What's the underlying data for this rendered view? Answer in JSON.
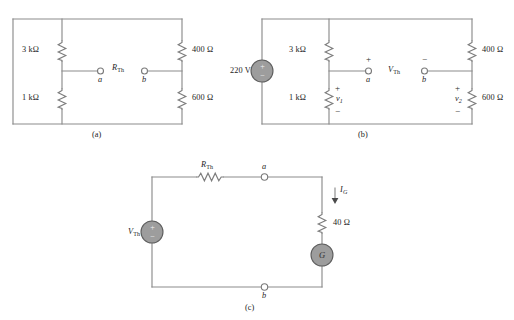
{
  "figure": {
    "background_color": "#ffffff",
    "wire_color": "#8c8c8c",
    "source_fill_color": "#9d9d9d",
    "terminal_fill_color": "#ffffff"
  },
  "circuits": [
    {
      "id": "circuit-a",
      "caption": "(a)",
      "components": {
        "r_top_left": "3 kΩ",
        "r_bottom_left": "1 kΩ",
        "r_top_right": "400 Ω",
        "r_bottom_right": "600 Ω",
        "terminal_left": "a",
        "terminal_right": "b",
        "bridge_label_main": "R",
        "bridge_label_sub": "Th"
      }
    },
    {
      "id": "circuit-b",
      "caption": "(b)",
      "components": {
        "source_value": "220 V",
        "source_plus": "+",
        "source_minus": "−",
        "r_top_left": "3 kΩ",
        "r_bottom_left": "1 kΩ",
        "r_top_right": "400 Ω",
        "r_bottom_right": "600 Ω",
        "terminal_left": "a",
        "terminal_right": "b",
        "terminal_left_sign": "+",
        "terminal_right_sign": "−",
        "bridge_label_main": "V",
        "bridge_label_sub": "Th",
        "v1_main": "v",
        "v1_sub": "1",
        "v1_plus": "+",
        "v1_minus": "−",
        "v2_main": "v",
        "v2_sub": "2",
        "v2_plus": "+",
        "v2_minus": "−"
      }
    },
    {
      "id": "circuit-c",
      "caption": "(c)",
      "components": {
        "source_main": "V",
        "source_sub": "Th",
        "source_plus": "+",
        "source_minus": "−",
        "resistor_main": "R",
        "resistor_sub": "Th",
        "terminal_top": "a",
        "terminal_bottom": "b",
        "series_resistor": "40 Ω",
        "current_main": "I",
        "current_sub": "G",
        "galvanometer": "G"
      }
    }
  ]
}
